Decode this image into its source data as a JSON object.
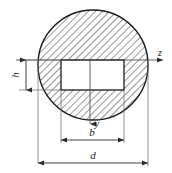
{
  "figure": {
    "type": "engineering-cross-section",
    "background_color": "#ffffff",
    "line_color": "#1a1a1a",
    "hatch_color": "#3a3a3a"
  },
  "shapes": {
    "circle": {
      "name": "hatched-circle",
      "center_x": 93,
      "center_y": 65,
      "radius": 55,
      "fill": "hatched-45deg"
    },
    "rectangle": {
      "name": "keyway-cutout",
      "x": 61,
      "y": 60,
      "width": 63,
      "height": 30,
      "fill": "#ffffff"
    }
  },
  "axes": {
    "horizontal": {
      "label": "z",
      "label_x": 160,
      "label_y": 56,
      "line_y": 60,
      "line_x1": 16,
      "line_x2": 163,
      "arrow": "right"
    },
    "vertical": {
      "label": "y",
      "label_x": 97,
      "label_y": 127,
      "line_x": 90,
      "line_y1": 60,
      "line_y2": 124,
      "arrow": "down"
    }
  },
  "dimensions": [
    {
      "label": "h",
      "name": "height-dimension",
      "orientation": "vertical",
      "rotated": true,
      "line_x": 26,
      "y1": 60,
      "y2": 90,
      "label_x": 19,
      "label_y": 75,
      "describes": "keyway height"
    },
    {
      "label": "b",
      "name": "width-dimension",
      "orientation": "horizontal",
      "line_y": 140,
      "x1": 61,
      "x2": 124,
      "label_x": 92,
      "label_y": 136,
      "describes": "keyway width"
    },
    {
      "label": "d",
      "name": "diameter-dimension",
      "orientation": "horizontal",
      "line_y": 163,
      "x1": 38,
      "x2": 148,
      "label_x": 93,
      "label_y": 159,
      "describes": "circle diameter"
    }
  ]
}
